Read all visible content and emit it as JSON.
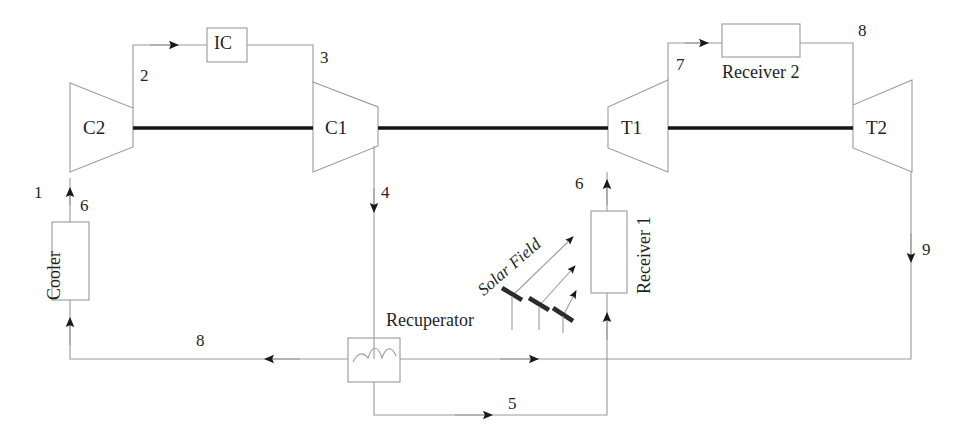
{
  "diagram": {
    "colors": {
      "line": "#9a9a9a",
      "shaft": "#1a1a1a",
      "text": "#1f1f1f",
      "mirror": "#2b2b2b",
      "background": "#ffffff"
    },
    "components": [
      {
        "id": "c2",
        "label": "C2",
        "type": "compressor",
        "orientation": "left-inlet"
      },
      {
        "id": "c1",
        "label": "C1",
        "type": "compressor",
        "orientation": "left-inlet"
      },
      {
        "id": "t1",
        "label": "T1",
        "type": "turbine",
        "orientation": "right-outlet"
      },
      {
        "id": "t2",
        "label": "T2",
        "type": "turbine",
        "orientation": "right-outlet"
      },
      {
        "id": "ic",
        "label": "IC",
        "type": "intercooler-box"
      },
      {
        "id": "cooler",
        "label": "Cooler",
        "type": "box-vertical"
      },
      {
        "id": "recuperator",
        "label": "Recuperator",
        "type": "heat-exchanger"
      },
      {
        "id": "receiver1",
        "label": "Receiver 1",
        "type": "box-vertical"
      },
      {
        "id": "receiver2",
        "label": "Receiver 2",
        "type": "box-horizontal"
      },
      {
        "id": "solarfield",
        "label": "Solar Field",
        "type": "mirror-field"
      }
    ],
    "state_points": [
      {
        "id": "p1",
        "label": "1"
      },
      {
        "id": "p2",
        "label": "2"
      },
      {
        "id": "p3",
        "label": "3"
      },
      {
        "id": "p4",
        "label": "4"
      },
      {
        "id": "p5",
        "label": "5"
      },
      {
        "id": "p6a",
        "label": "6"
      },
      {
        "id": "p6b",
        "label": "6"
      },
      {
        "id": "p7",
        "label": "7"
      },
      {
        "id": "p8a",
        "label": "8"
      },
      {
        "id": "p8b",
        "label": "8"
      },
      {
        "id": "p9",
        "label": "9"
      }
    ]
  }
}
